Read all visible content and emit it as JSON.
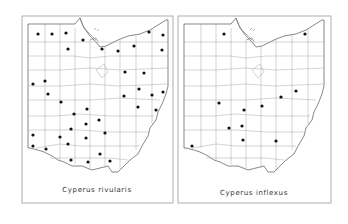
{
  "figure": {
    "panels": [
      {
        "id": "left",
        "title": "Cyperus rivularis",
        "offset_x": 0,
        "dots": [
          [
            38,
            34
          ],
          [
            52,
            34
          ],
          [
            66,
            33
          ],
          [
            83,
            40
          ],
          [
            68,
            49
          ],
          [
            102,
            49
          ],
          [
            118,
            51
          ],
          [
            134,
            46
          ],
          [
            149,
            32
          ],
          [
            163,
            35
          ],
          [
            162,
            50
          ],
          [
            33,
            84
          ],
          [
            45,
            81
          ],
          [
            48,
            94
          ],
          [
            61,
            102
          ],
          [
            125,
            72
          ],
          [
            144,
            73
          ],
          [
            139,
            89
          ],
          [
            124,
            96
          ],
          [
            152,
            95
          ],
          [
            163,
            92
          ],
          [
            138,
            107
          ],
          [
            156,
            110
          ],
          [
            87,
            109
          ],
          [
            74,
            114
          ],
          [
            99,
            120
          ],
          [
            86,
            124
          ],
          [
            71,
            129
          ],
          [
            105,
            133
          ],
          [
            33,
            135
          ],
          [
            60,
            137
          ],
          [
            86,
            138
          ],
          [
            68,
            144
          ],
          [
            33,
            146
          ],
          [
            46,
            149
          ],
          [
            100,
            154
          ],
          [
            71,
            160
          ],
          [
            88,
            162
          ],
          [
            110,
            161
          ]
        ]
      },
      {
        "id": "right",
        "title": "Cyperus inflexus",
        "offset_x": 156,
        "dots": [
          [
            224,
            34
          ],
          [
            305,
            34
          ],
          [
            296,
            91
          ],
          [
            281,
            97
          ],
          [
            219,
            103
          ],
          [
            244,
            110
          ],
          [
            262,
            106
          ],
          [
            242,
            126
          ],
          [
            229,
            128
          ],
          [
            243,
            140
          ],
          [
            276,
            141
          ],
          [
            192,
            146
          ]
        ]
      }
    ],
    "map_region": "Ohio county map",
    "colors": {
      "dot": "#111111",
      "border": "#555555",
      "county": "#9e9e9e"
    }
  }
}
